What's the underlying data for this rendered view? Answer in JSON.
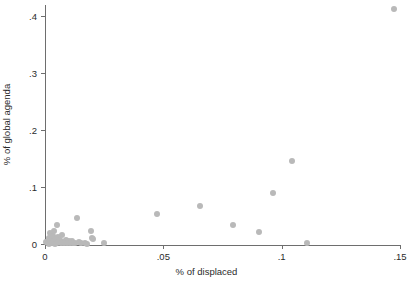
{
  "chart_data": {
    "type": "scatter",
    "title": "",
    "xlabel": "% of displaced",
    "ylabel": "% of global agenda",
    "xlim": [
      0,
      0.15
    ],
    "ylim": [
      0,
      0.42
    ],
    "xticks": [
      0,
      0.05,
      0.1,
      0.15
    ],
    "xtick_labels": [
      "0",
      ".05",
      ".1",
      ".15"
    ],
    "yticks": [
      0,
      0.1,
      0.2,
      0.3,
      0.4
    ],
    "ytick_labels": [
      "0",
      ".1",
      ".2",
      ".3",
      ".4"
    ],
    "grid": false,
    "legend": null,
    "marker_color": "#b9b9b9",
    "axis_color": "#6e6e6e",
    "points": [
      {
        "x": 0.0006,
        "y": 0.0035
      },
      {
        "x": 0.0012,
        "y": 0.0015
      },
      {
        "x": 0.0015,
        "y": 0.0105
      },
      {
        "x": 0.0018,
        "y": 0.0005
      },
      {
        "x": 0.0022,
        "y": 0.0185
      },
      {
        "x": 0.0024,
        "y": 0.0065
      },
      {
        "x": 0.0028,
        "y": 0.0012
      },
      {
        "x": 0.0032,
        "y": 0.0145
      },
      {
        "x": 0.0036,
        "y": 0.0045
      },
      {
        "x": 0.004,
        "y": 0.0225
      },
      {
        "x": 0.0042,
        "y": 0.0008
      },
      {
        "x": 0.0046,
        "y": 0.009
      },
      {
        "x": 0.005,
        "y": 0.002
      },
      {
        "x": 0.0052,
        "y": 0.034
      },
      {
        "x": 0.0056,
        "y": 0.0125
      },
      {
        "x": 0.006,
        "y": 0.003
      },
      {
        "x": 0.0064,
        "y": 0.0062
      },
      {
        "x": 0.0068,
        "y": 0.001
      },
      {
        "x": 0.0072,
        "y": 0.0155
      },
      {
        "x": 0.0076,
        "y": 0.0042
      },
      {
        "x": 0.0082,
        "y": 0.0018
      },
      {
        "x": 0.0088,
        "y": 0.0072
      },
      {
        "x": 0.0094,
        "y": 0.0026
      },
      {
        "x": 0.01,
        "y": 0.0048
      },
      {
        "x": 0.0106,
        "y": 0.0009
      },
      {
        "x": 0.0112,
        "y": 0.006
      },
      {
        "x": 0.012,
        "y": 0.0022
      },
      {
        "x": 0.0128,
        "y": 0.0011
      },
      {
        "x": 0.0136,
        "y": 0.045
      },
      {
        "x": 0.0142,
        "y": 0.003
      },
      {
        "x": 0.0152,
        "y": 0.0014
      },
      {
        "x": 0.0168,
        "y": 0.0015
      },
      {
        "x": 0.0178,
        "y": 0.0002
      },
      {
        "x": 0.0196,
        "y": 0.0235
      },
      {
        "x": 0.02,
        "y": 0.0105
      },
      {
        "x": 0.0204,
        "y": 0.0085
      },
      {
        "x": 0.025,
        "y": 0.001
      },
      {
        "x": 0.0475,
        "y": 0.0535
      },
      {
        "x": 0.0655,
        "y": 0.067
      },
      {
        "x": 0.0795,
        "y": 0.033
      },
      {
        "x": 0.0905,
        "y": 0.021
      },
      {
        "x": 0.0965,
        "y": 0.0905
      },
      {
        "x": 0.1045,
        "y": 0.146
      },
      {
        "x": 0.1105,
        "y": 0.002
      },
      {
        "x": 0.1475,
        "y": 0.413
      }
    ]
  }
}
